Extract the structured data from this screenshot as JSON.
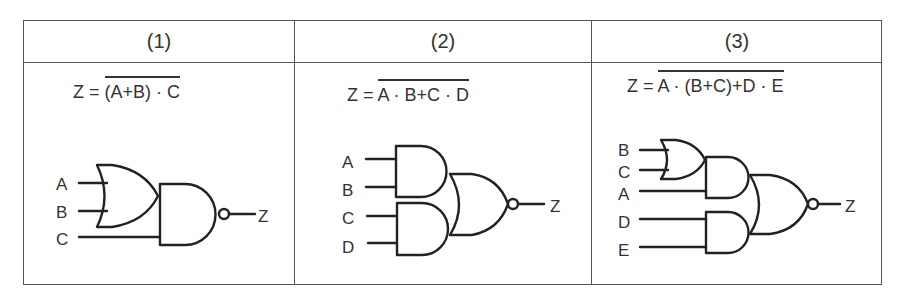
{
  "table": {
    "headers": [
      "(1)",
      "(2)",
      "(3)"
    ],
    "panels": [
      {
        "formula_lhs": "Z =",
        "formula_overbar": "(A+B) · C",
        "inputs": [
          "A",
          "B",
          "C"
        ],
        "output": "Z",
        "gates": [
          "OR(A,B)",
          "NAND(OR, C)"
        ]
      },
      {
        "formula_lhs": "Z =",
        "formula_overbar": "A · B+C · D",
        "inputs": [
          "A",
          "B",
          "C",
          "D"
        ],
        "output": "Z",
        "gates": [
          "AND(A,B)",
          "AND(C,D)",
          "NOR(AND1, AND2)"
        ]
      },
      {
        "formula_lhs": "Z =",
        "formula_overbar": "A · (B+C)+D · E",
        "inputs": [
          "B",
          "C",
          "A",
          "D",
          "E"
        ],
        "output": "Z",
        "gates": [
          "OR(B,C)",
          "AND(OR, A)",
          "AND(D,E)",
          "NOR(AND1, AND2)"
        ]
      }
    ]
  },
  "colors": {
    "line": "#222222",
    "border": "#555555",
    "background": "#ffffff"
  }
}
